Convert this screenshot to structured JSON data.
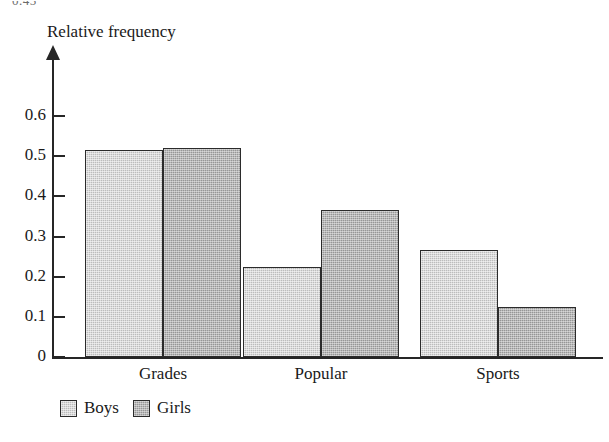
{
  "artifact": {
    "top_fragment": "0.45"
  },
  "chart_data": {
    "type": "bar",
    "title": "",
    "xlabel": "",
    "ylabel": "Relative frequency",
    "categories": [
      "Grades",
      "Popular",
      "Sports"
    ],
    "series": [
      {
        "name": "Boys",
        "color": "#bcbcbc",
        "values": [
          0.515,
          0.224,
          0.266
        ]
      },
      {
        "name": "Girls",
        "color": "#969696",
        "values": [
          0.52,
          0.366,
          0.124
        ]
      }
    ],
    "ylim": [
      0,
      0.65
    ],
    "yticks": [
      0,
      0.1,
      0.2,
      0.3,
      0.4,
      0.5,
      0.6
    ],
    "ytick_labels": [
      "0",
      "0.1",
      "0.2",
      "0.3",
      "0.4",
      "0.5",
      "0.6"
    ],
    "grid": false,
    "legend_position": "bottom-left",
    "axis_arrow": true,
    "bar_style": "grouped-adjacent"
  },
  "legend": {
    "items": [
      {
        "label": "Boys",
        "swatch": "boys"
      },
      {
        "label": "Girls",
        "swatch": "girls"
      }
    ]
  }
}
